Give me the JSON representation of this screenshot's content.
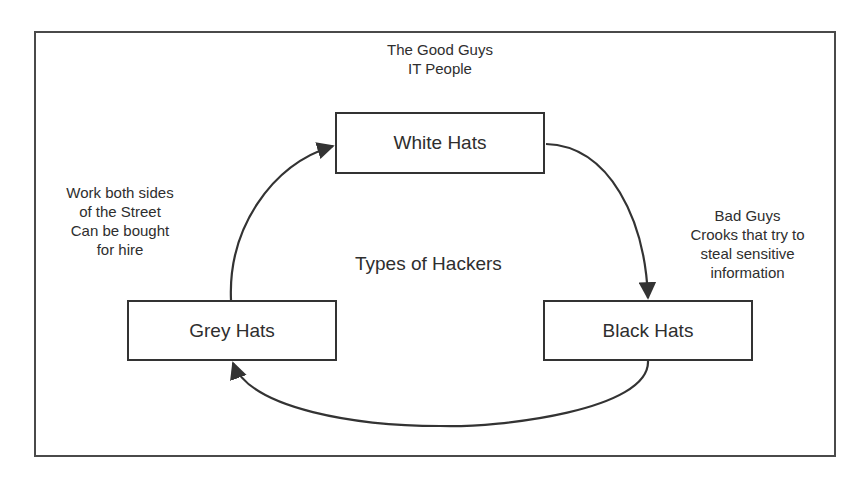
{
  "diagram": {
    "title": "Types of Hackers",
    "nodes": [
      {
        "id": "white",
        "label": "White Hats"
      },
      {
        "id": "black",
        "label": "Black Hats"
      },
      {
        "id": "grey",
        "label": "Grey Hats"
      }
    ],
    "annotations": {
      "white": "The Good Guys\nIT People",
      "black": "Bad Guys\nCrooks that try to\nsteal sensitive\ninformation",
      "grey": "Work both sides\nof the Street\nCan be bought\nfor hire"
    },
    "edges": [
      {
        "from": "grey",
        "to": "white"
      },
      {
        "from": "white",
        "to": "black"
      },
      {
        "from": "black",
        "to": "grey"
      }
    ],
    "colors": {
      "stroke": "#333333",
      "text": "#2e2e2e",
      "background": "#ffffff"
    }
  }
}
